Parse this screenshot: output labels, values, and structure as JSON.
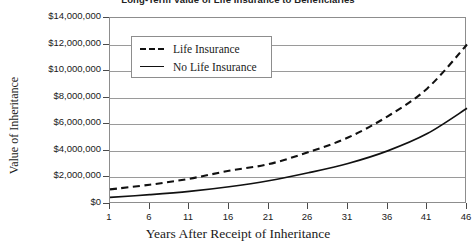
{
  "chart_data": {
    "type": "line",
    "title": "Long-Term Value of Life Insurance to Beneficiaries",
    "xlabel": "Years After Receipt of Inheritance",
    "ylabel": "Value of Inheritance",
    "x": [
      1,
      6,
      11,
      16,
      21,
      26,
      31,
      36,
      41,
      46
    ],
    "xlim": [
      1,
      46
    ],
    "ylim": [
      0,
      14000000
    ],
    "grid": true,
    "legend_position": "top-left inside plot",
    "y_ticks": [
      0,
      2000000,
      4000000,
      6000000,
      8000000,
      10000000,
      12000000,
      14000000
    ],
    "y_tick_labels": [
      "$0",
      "$2,000,000",
      "$4,000,000",
      "$6,000,000",
      "$8,000,000",
      "$10,000,000",
      "$12,000,000",
      "$14,000,000"
    ],
    "x_tick_labels": [
      "1",
      "6",
      "11",
      "16",
      "21",
      "26",
      "31",
      "36",
      "41",
      "46"
    ],
    "series": [
      {
        "name": "Life Insurance",
        "style": "dashed",
        "color": "#111111",
        "values": [
          1100000,
          1450000,
          1900000,
          2500000,
          3000000,
          3900000,
          5000000,
          6600000,
          8700000,
          12000000
        ]
      },
      {
        "name": "No Life Insurance",
        "style": "solid",
        "color": "#111111",
        "values": [
          500000,
          700000,
          950000,
          1300000,
          1750000,
          2350000,
          3050000,
          4000000,
          5300000,
          7200000
        ]
      }
    ]
  }
}
